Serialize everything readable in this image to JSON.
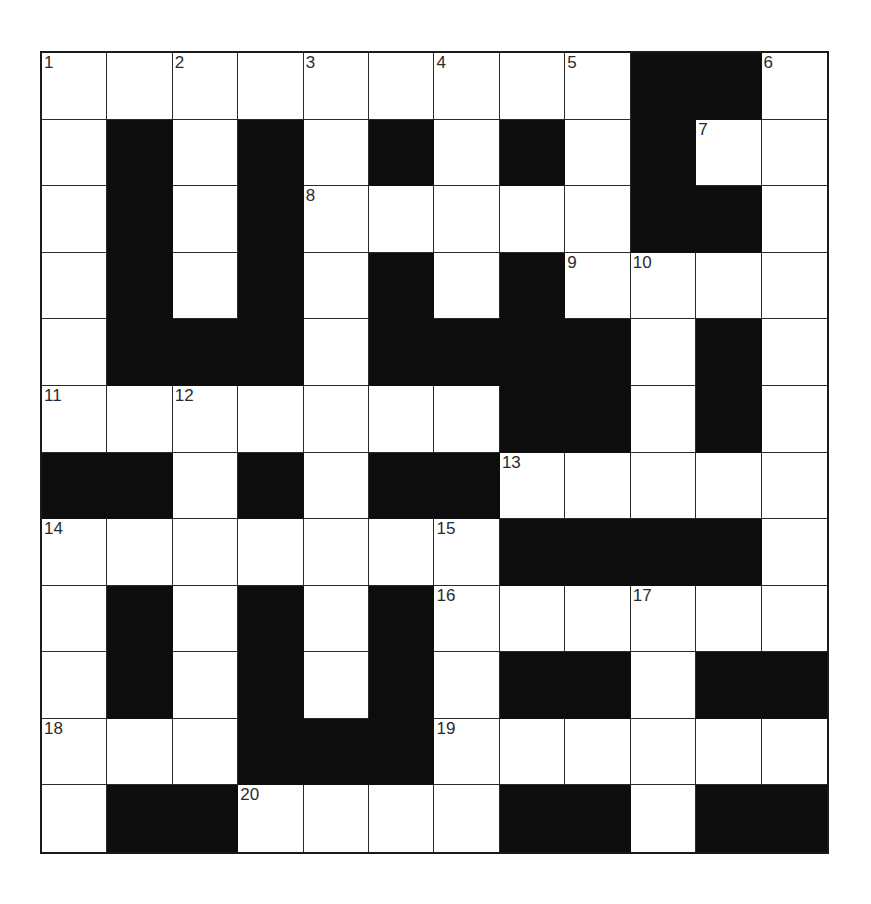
{
  "puzzle": {
    "rows": 12,
    "cols": 12,
    "layout": [
      "WWWWWWWWWBBW",
      "WBWBWBWBWBWW",
      "WBWBWWWWWBBW",
      "WBWBWBWBWWWW",
      "WBBBWBBBBWBW",
      "WWWWWWWBBWBW",
      "BBWBWBBWWWWW",
      "WWWWWWWBBBBW",
      "WBWBWBWWWWWW",
      "WBWBWBWBBWBB",
      "WWWBBBWWWWWW",
      "WBBWWWWBBWBB"
    ],
    "numbers": [
      {
        "r": 0,
        "c": 0,
        "n": "1"
      },
      {
        "r": 0,
        "c": 2,
        "n": "2"
      },
      {
        "r": 0,
        "c": 4,
        "n": "3"
      },
      {
        "r": 0,
        "c": 6,
        "n": "4"
      },
      {
        "r": 0,
        "c": 8,
        "n": "5"
      },
      {
        "r": 0,
        "c": 11,
        "n": "6"
      },
      {
        "r": 1,
        "c": 10,
        "n": "7"
      },
      {
        "r": 2,
        "c": 4,
        "n": "8"
      },
      {
        "r": 3,
        "c": 8,
        "n": "9"
      },
      {
        "r": 3,
        "c": 9,
        "n": "10"
      },
      {
        "r": 5,
        "c": 0,
        "n": "11"
      },
      {
        "r": 5,
        "c": 2,
        "n": "12"
      },
      {
        "r": 6,
        "c": 7,
        "n": "13"
      },
      {
        "r": 7,
        "c": 0,
        "n": "14"
      },
      {
        "r": 7,
        "c": 6,
        "n": "15"
      },
      {
        "r": 8,
        "c": 6,
        "n": "16"
      },
      {
        "r": 8,
        "c": 9,
        "n": "17"
      },
      {
        "r": 10,
        "c": 0,
        "n": "18"
      },
      {
        "r": 10,
        "c": 6,
        "n": "19"
      },
      {
        "r": 11,
        "c": 3,
        "n": "20"
      }
    ],
    "colors": {
      "black_cell": "#0d0d0d",
      "white_cell": "#ffffff",
      "grid_line": "#2a2a2a",
      "number_text": "#2b2b2b"
    }
  }
}
